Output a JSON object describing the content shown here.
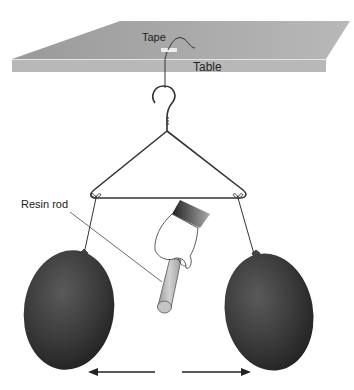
{
  "diagram": {
    "labels": {
      "tape": "Tape",
      "table": "Table",
      "resin_rod": "Resin rod"
    },
    "elements": {
      "table": "table-surface",
      "tape": "tape-strip",
      "hanger": "wire-hanger",
      "hand": "hand-holding-rod",
      "rod": "resin-rod",
      "balloon_left": "balloon",
      "balloon_right": "balloon",
      "arrow_left": "arrow-left",
      "arrow_right": "arrow-right"
    },
    "colors": {
      "table_top": "#a8a8a8",
      "table_edge": "#b5b5b5",
      "balloon": "#3a3a3a",
      "rod": "#bcbcbc",
      "line": "#333333"
    }
  }
}
